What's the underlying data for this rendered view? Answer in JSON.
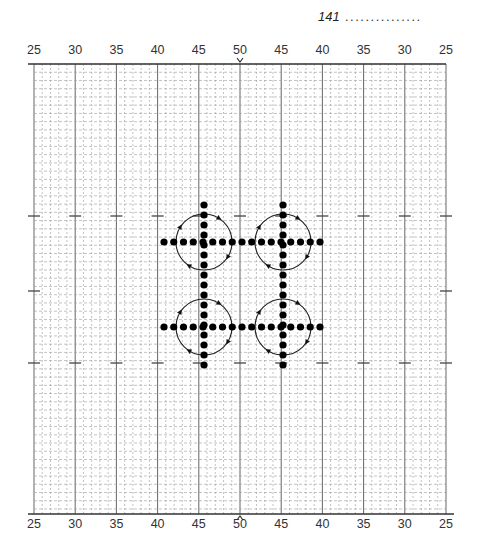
{
  "header": {
    "page_number": "141",
    "leader": "..............."
  },
  "scale": {
    "top_labels": [
      "25",
      "30",
      "35",
      "40",
      "45",
      "50",
      "45",
      "40",
      "35",
      "30",
      "25"
    ],
    "bottom_labels": [
      "25",
      "30",
      "35",
      "40",
      "45",
      "50",
      "45",
      "40",
      "35",
      "30",
      "25"
    ],
    "center_marker_top": "v",
    "center_marker_bottom": "^"
  },
  "grid": {
    "left": 34,
    "right": 446,
    "top": 64,
    "bottom": 514,
    "stitch_px": 8.24,
    "major_every": 5,
    "line_color": "#555555",
    "minor_color": "#9a9a9a"
  },
  "pattern": {
    "dot_color": "#000000",
    "dot_spacing": 9.75,
    "horizontal_rows": [
      {
        "y": 242,
        "x_start": 164,
        "count": 17
      },
      {
        "y": 327,
        "x_start": 164,
        "count": 17
      }
    ],
    "vertical_columns": [
      {
        "x": 204,
        "y_start": 205,
        "count": 17
      },
      {
        "x": 283,
        "y_start": 205,
        "count": 17
      }
    ],
    "circles": [
      {
        "cx": 204,
        "cy": 242,
        "r": 28
      },
      {
        "cx": 283,
        "cy": 242,
        "r": 28
      },
      {
        "cx": 204,
        "cy": 327,
        "r": 28
      },
      {
        "cx": 283,
        "cy": 327,
        "r": 28
      }
    ]
  }
}
